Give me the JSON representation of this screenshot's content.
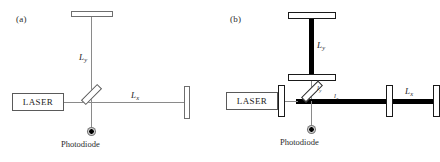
{
  "figure": {
    "panels": [
      {
        "id": "a",
        "label": "(a)",
        "source_label": "LASER",
        "detector_label": "Photodiode",
        "arm_labels": [
          {
            "name": "vertical-arm",
            "base": "L",
            "sub": "y"
          },
          {
            "name": "horizontal-arm",
            "base": "L",
            "sub": "x"
          }
        ]
      },
      {
        "id": "b",
        "label": "(b)",
        "source_label": "LASER",
        "detector_label": "Photodiode",
        "arm_labels": [
          {
            "name": "vertical-cavity-arm",
            "base": "L",
            "sub": "y"
          },
          {
            "name": "horizontal-cavity-arm",
            "base": "L",
            "sub": "x"
          },
          {
            "name": "vertical-short-arm",
            "base": "l",
            "sub": "y"
          },
          {
            "name": "horizontal-short-arm",
            "base": "l",
            "sub": "x"
          }
        ]
      }
    ]
  },
  "colors": {
    "background": "#ffffff",
    "thin_beam": "#8a8a8a",
    "thick_beam": "#000000",
    "mirror_fill": "#ffffff",
    "mirror_stroke": "#6e6e6e",
    "mirror_stroke_strong": "#1a1a1a",
    "text": "#1f1f1f"
  }
}
